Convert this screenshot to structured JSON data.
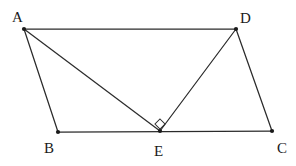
{
  "figure": {
    "background_color": "#ffffff",
    "line_color": "#2b2b2b",
    "label_color": "#1a1a1a",
    "vertex_color": "#1a1a1a",
    "width": 296,
    "height": 166,
    "points": [
      {
        "id": "A",
        "label": "A",
        "x": 24,
        "y": 29,
        "label_x": 12,
        "label_y": 22
      },
      {
        "id": "B",
        "label": "B",
        "x": 58,
        "y": 132,
        "label_x": 44,
        "label_y": 153
      },
      {
        "id": "C",
        "label": "C",
        "x": 272,
        "y": 131,
        "label_x": 277,
        "label_y": 153
      },
      {
        "id": "D",
        "label": "D",
        "x": 236,
        "y": 29,
        "label_x": 240,
        "label_y": 23
      },
      {
        "id": "E",
        "label": "E",
        "x": 160,
        "y": 131,
        "label_x": 154,
        "label_y": 156
      }
    ],
    "segments": [
      {
        "id": "AD",
        "from": "A",
        "to": "D"
      },
      {
        "id": "AB",
        "from": "A",
        "to": "B"
      },
      {
        "id": "AE",
        "from": "A",
        "to": "E"
      },
      {
        "id": "DE",
        "from": "D",
        "to": "E"
      },
      {
        "id": "DC",
        "from": "D",
        "to": "C"
      },
      {
        "id": "BC",
        "from": "B",
        "to": "C"
      }
    ],
    "angle_markers": [
      {
        "id": "angle-AED",
        "at": "E",
        "type": "right-angle",
        "shape": "diamond",
        "measure": "90",
        "center_x": 160,
        "center_y": 124,
        "size": 5
      }
    ]
  }
}
